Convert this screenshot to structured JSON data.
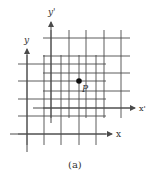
{
  "figure": {
    "caption": "(a)",
    "point_label": "P",
    "axes": {
      "original": {
        "x_label": "x",
        "y_label": "y"
      },
      "transformed": {
        "x_label": "x'",
        "y_label": "y'"
      }
    },
    "colors": {
      "line": "#4a4a4a",
      "point": "#111111",
      "text": "#333333"
    }
  },
  "grids": {
    "original": {
      "vertical_x": [
        27,
        44,
        61,
        79,
        96
      ],
      "horizontal_y": [
        64,
        81,
        99,
        116,
        134
      ],
      "h_extent": [
        18,
        106
      ],
      "v_extent": [
        55,
        145
      ]
    },
    "transformed": {
      "vertical_x": [
        51,
        69,
        86,
        104,
        121
      ],
      "horizontal_y": [
        38,
        56,
        73,
        91,
        108
      ],
      "h_extent": [
        43,
        130
      ],
      "v_extent": [
        30,
        118
      ]
    }
  }
}
